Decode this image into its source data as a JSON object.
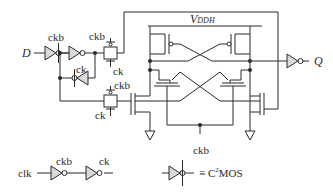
{
  "diagram": {
    "signals": {
      "input": "D",
      "output": "Q",
      "supply": "V",
      "supply_sub": "DDH"
    },
    "clock_labels": {
      "ckb_first_inv": "ckb",
      "ck_feedback_inv": "ck",
      "ckb_tg_top_p": "ckb",
      "ck_tg_top_n": "ck",
      "ckb_tg_bottom_p": "ckb",
      "ck_tg_bottom_n": "ck",
      "ckb_pulldown": "ckb"
    },
    "legend": {
      "clock_gen": {
        "input": "clk",
        "mid": "ckb",
        "out": "ck"
      },
      "equivalence": {
        "symbol": "≡",
        "text_prefix": "C",
        "text_sup": "2",
        "text_suffix": "MOS"
      }
    },
    "colors": {
      "line": "#2a2a2a",
      "fill_inverter": "#d9d9d9",
      "background": "#ffffff"
    }
  }
}
